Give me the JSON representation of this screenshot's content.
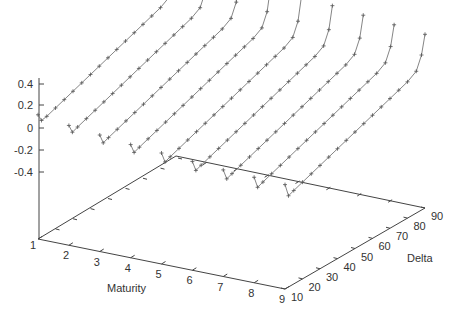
{
  "chart_data": {
    "type": "line3d",
    "title": "",
    "xlabel": "Maturity",
    "ylabel": "Delta",
    "zlabel": "",
    "x_ticks": [
      "1",
      "2",
      "3",
      "4",
      "5",
      "6",
      "7",
      "8",
      "9"
    ],
    "y_ticks": [
      "10",
      "20",
      "30",
      "40",
      "50",
      "60",
      "70",
      "80",
      "90"
    ],
    "z_ticks": [
      "0.4",
      "0.2",
      "0",
      "-0.2",
      "-0.4"
    ],
    "xlim": [
      1,
      9
    ],
    "ylim": [
      10,
      90
    ],
    "zlim": [
      -0.4,
      0.4
    ],
    "grid": false,
    "series_note": "One curve per Maturity (1..9), plotted along Delta; each dips near low delta then rises roughly linearly and sharply upward near high delta",
    "series": [
      {
        "name": "Maturity 1",
        "x": [
          10,
          12,
          15,
          20,
          25,
          30,
          35,
          40,
          45,
          50,
          55,
          60,
          65,
          70,
          75,
          80,
          85,
          88,
          90
        ],
        "z": [
          0.12,
          0.05,
          0.06,
          0.09,
          0.12,
          0.15,
          0.18,
          0.21,
          0.24,
          0.27,
          0.3,
          0.33,
          0.36,
          0.39,
          0.42,
          0.45,
          0.5,
          0.62,
          0.85
        ]
      },
      {
        "name": "Maturity 2",
        "x": [
          10,
          12,
          15,
          20,
          25,
          30,
          35,
          40,
          45,
          50,
          55,
          60,
          65,
          70,
          75,
          80,
          85,
          88,
          90
        ],
        "z": [
          0.08,
          0.0,
          0.02,
          0.05,
          0.08,
          0.11,
          0.14,
          0.17,
          0.2,
          0.23,
          0.26,
          0.29,
          0.32,
          0.35,
          0.38,
          0.41,
          0.46,
          0.58,
          0.8
        ]
      },
      {
        "name": "Maturity 3",
        "x": [
          10,
          12,
          15,
          20,
          25,
          30,
          35,
          40,
          45,
          50,
          55,
          60,
          65,
          70,
          75,
          80,
          85,
          88,
          90
        ],
        "z": [
          0.05,
          -0.04,
          -0.02,
          0.01,
          0.04,
          0.07,
          0.1,
          0.13,
          0.16,
          0.19,
          0.22,
          0.25,
          0.28,
          0.31,
          0.34,
          0.37,
          0.42,
          0.54,
          0.76
        ]
      },
      {
        "name": "Maturity 4",
        "x": [
          10,
          12,
          15,
          20,
          25,
          30,
          35,
          40,
          45,
          50,
          55,
          60,
          65,
          70,
          75,
          80,
          85,
          88,
          90
        ],
        "z": [
          0.02,
          -0.07,
          -0.05,
          -0.02,
          0.01,
          0.04,
          0.07,
          0.1,
          0.13,
          0.16,
          0.19,
          0.22,
          0.25,
          0.28,
          0.31,
          0.34,
          0.39,
          0.51,
          0.72
        ]
      },
      {
        "name": "Maturity 5",
        "x": [
          10,
          12,
          15,
          20,
          25,
          30,
          35,
          40,
          45,
          50,
          55,
          60,
          65,
          70,
          75,
          80,
          85,
          88,
          90
        ],
        "z": [
          0.0,
          -0.1,
          -0.08,
          -0.05,
          -0.02,
          0.01,
          0.04,
          0.07,
          0.1,
          0.13,
          0.16,
          0.19,
          0.22,
          0.25,
          0.28,
          0.31,
          0.36,
          0.48,
          0.69
        ]
      },
      {
        "name": "Maturity 6",
        "x": [
          10,
          12,
          15,
          20,
          25,
          30,
          35,
          40,
          45,
          50,
          55,
          60,
          65,
          70,
          75,
          80,
          85,
          88,
          90
        ],
        "z": [
          -0.02,
          -0.12,
          -0.1,
          -0.07,
          -0.04,
          -0.01,
          0.02,
          0.05,
          0.08,
          0.11,
          0.14,
          0.17,
          0.2,
          0.23,
          0.26,
          0.29,
          0.34,
          0.46,
          0.66
        ]
      },
      {
        "name": "Maturity 7",
        "x": [
          10,
          12,
          15,
          20,
          25,
          30,
          35,
          40,
          45,
          50,
          55,
          60,
          65,
          70,
          75,
          80,
          85,
          88,
          90
        ],
        "z": [
          -0.04,
          -0.14,
          -0.12,
          -0.09,
          -0.06,
          -0.03,
          0.0,
          0.03,
          0.06,
          0.09,
          0.12,
          0.15,
          0.18,
          0.21,
          0.24,
          0.27,
          0.32,
          0.44,
          0.63
        ]
      },
      {
        "name": "Maturity 8",
        "x": [
          10,
          12,
          15,
          20,
          25,
          30,
          35,
          40,
          45,
          50,
          55,
          60,
          65,
          70,
          75,
          80,
          85,
          88,
          90
        ],
        "z": [
          -0.05,
          -0.16,
          -0.14,
          -0.11,
          -0.08,
          -0.05,
          -0.02,
          0.01,
          0.04,
          0.07,
          0.1,
          0.13,
          0.16,
          0.19,
          0.22,
          0.25,
          0.3,
          0.42,
          0.6
        ]
      },
      {
        "name": "Maturity 9",
        "x": [
          10,
          12,
          15,
          20,
          25,
          30,
          35,
          40,
          45,
          50,
          55,
          60,
          65,
          70,
          75,
          80,
          85,
          88,
          90
        ],
        "z": [
          -0.06,
          -0.18,
          -0.16,
          -0.13,
          -0.1,
          -0.07,
          -0.04,
          -0.01,
          0.02,
          0.05,
          0.08,
          0.11,
          0.14,
          0.17,
          0.2,
          0.23,
          0.28,
          0.4,
          0.57
        ]
      }
    ]
  },
  "labels": {
    "x_axis_title": "Maturity",
    "y_axis_title": "Delta"
  }
}
